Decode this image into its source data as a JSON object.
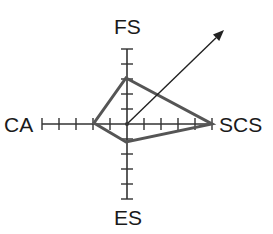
{
  "diagram": {
    "type": "radar-vector",
    "center": [
      127,
      124
    ],
    "axes": [
      {
        "id": "fs",
        "label": "FS",
        "direction": "up",
        "ticks": 5,
        "tick_spacing": 15,
        "value": 3
      },
      {
        "id": "scs",
        "label": "SCS",
        "direction": "right",
        "ticks": 5,
        "tick_spacing": 17,
        "value": 5
      },
      {
        "id": "es",
        "label": "ES",
        "direction": "down",
        "ticks": 5,
        "tick_spacing": 15,
        "value": 1
      },
      {
        "id": "ca",
        "label": "CA",
        "direction": "left",
        "ticks": 5,
        "tick_spacing": 17,
        "value": 2
      }
    ],
    "polygon_points": [
      [
        126,
        78
      ],
      [
        212,
        124
      ],
      [
        126,
        142
      ],
      [
        94,
        123
      ]
    ],
    "arrow": {
      "from": [
        127,
        124
      ],
      "to": [
        224,
        30
      ]
    },
    "colors": {
      "axis": "#333333",
      "polygon": "#555555",
      "arrow": "#222222",
      "label": "#1a1a1a"
    }
  },
  "labels": {
    "fs": "FS",
    "scs": "SCS",
    "es": "ES",
    "ca": "CA"
  }
}
